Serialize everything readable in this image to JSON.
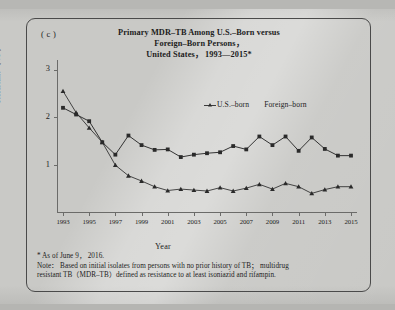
{
  "figure": {
    "panel_label": "( c )",
    "title_lines": [
      "Primary MDR–TB Among U.S.–Born versus",
      "Foreign–Born Persons，",
      "United States，  1993—2015*"
    ],
    "x_axis_title": "Year",
    "y_axis_title": "Resistant（ % ）",
    "footnotes": [
      "* As of June 9， 2016.",
      "Note：  Based on initial isolates from persons with no prior history of TB；  multidrug",
      "resistant TB（MDR–TB）defined as resistance to at least isoniazid and rifampin."
    ]
  },
  "chart_data": {
    "type": "line",
    "xlabel": "Year",
    "ylabel": "Resistant ( % )",
    "xlim": [
      1993,
      2015
    ],
    "ylim": [
      0,
      3.2
    ],
    "yticks": [
      1,
      2,
      3
    ],
    "ytick_labels": [
      "1",
      "2",
      "3"
    ],
    "xticks": [
      1993,
      1995,
      1997,
      1999,
      2001,
      2003,
      2005,
      2007,
      2009,
      2011,
      2013,
      2015
    ],
    "xtick_labels": [
      "1993",
      "1995",
      "1997",
      "1999",
      "2001",
      "2003",
      "2005",
      "2007",
      "2009",
      "2011",
      "2013",
      "2015"
    ],
    "grid": false,
    "legend_position": "upper right",
    "x": [
      1993,
      1994,
      1995,
      1996,
      1997,
      1998,
      1999,
      2000,
      2001,
      2002,
      2003,
      2004,
      2005,
      2006,
      2007,
      2008,
      2009,
      2010,
      2011,
      2012,
      2013,
      2014,
      2015
    ],
    "series": [
      {
        "name": "U.S.–born",
        "marker": "triangle",
        "color": "#2a2a2a",
        "values": [
          2.55,
          2.1,
          1.78,
          1.48,
          1.0,
          0.78,
          0.67,
          0.55,
          0.47,
          0.5,
          0.48,
          0.46,
          0.53,
          0.46,
          0.52,
          0.6,
          0.5,
          0.62,
          0.55,
          0.41,
          0.49,
          0.55,
          0.55
        ]
      },
      {
        "name": "Foreign–born",
        "marker": "square",
        "color": "#2a2a2a",
        "values": [
          2.2,
          2.06,
          1.92,
          1.48,
          1.22,
          1.62,
          1.42,
          1.32,
          1.33,
          1.17,
          1.22,
          1.25,
          1.27,
          1.4,
          1.33,
          1.6,
          1.42,
          1.6,
          1.3,
          1.58,
          1.34,
          1.2,
          1.2
        ]
      }
    ]
  }
}
